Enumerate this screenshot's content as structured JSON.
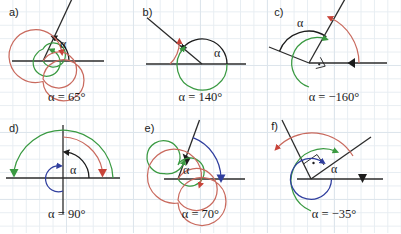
{
  "figure": {
    "background": "#ffffff",
    "grid_color": "#e7edf2",
    "colors": {
      "axis": "#2b2b2b",
      "ray": "#2b2b2b",
      "angle_arc": "#1c1c1c",
      "green": "#3a9a42",
      "red": "#c8443a",
      "salmon": "#c96a5e",
      "blue": "#2f3e9e",
      "text": "#1c1c1c"
    },
    "width": 401,
    "height": 233
  },
  "panels": [
    {
      "id": "a",
      "label": "a)",
      "alpha_symbol": "α",
      "equation": "α = 65°",
      "angle_deg": 65,
      "arcs": [
        {
          "name": "angle-arc",
          "color": "#1c1c1c",
          "direction": "counterclockwise",
          "from_deg": 0,
          "to_deg": 65,
          "turns": 0
        },
        {
          "name": "green-coterminal-arc",
          "color": "#3a9a42",
          "direction": "counterclockwise",
          "from_deg": 0,
          "to_deg": 65,
          "turns": 1
        },
        {
          "name": "red-coterminal-arc",
          "color": "#c8443a",
          "direction": "counterclockwise",
          "from_deg": 0,
          "to_deg": 65,
          "turns": 2
        }
      ],
      "has_right_angle_marker": false,
      "has_vertical_axis": false
    },
    {
      "id": "b",
      "label": "b)",
      "alpha_symbol": "α",
      "equation": "α = 140°",
      "angle_deg": 140,
      "arcs": [
        {
          "name": "angle-arc",
          "color": "#1c1c1c",
          "direction": "counterclockwise",
          "from_deg": 0,
          "to_deg": 140,
          "turns": 0
        },
        {
          "name": "green-coterminal-arc",
          "color": "#3a9a42",
          "direction": "counterclockwise",
          "from_deg": 0,
          "to_deg": 140,
          "turns": 1
        },
        {
          "name": "red-coterminal-arc",
          "color": "#c8443a",
          "direction": "counterclockwise",
          "from_deg": 0,
          "to_deg": 140,
          "turns": 1
        }
      ],
      "has_right_angle_marker": false,
      "has_vertical_axis": false
    },
    {
      "id": "c",
      "label": "c)",
      "alpha_symbol": "α",
      "equation": "α = −160°",
      "angle_deg": -160,
      "arcs": [
        {
          "name": "angle-arc",
          "color": "#1c1c1c",
          "direction": "counterclockwise",
          "from_deg": 20,
          "to_deg": 180,
          "turns": 0
        },
        {
          "name": "green-coterminal-arc",
          "color": "#3a9a42",
          "direction": "counterclockwise",
          "from_deg": 100,
          "to_deg": 100,
          "turns": 1
        },
        {
          "name": "red-coterminal-arc",
          "color": "#c8443a",
          "direction": "clockwise",
          "from_deg": 0,
          "to_deg": -160,
          "turns": 0
        }
      ],
      "has_right_angle_marker": true,
      "has_vertical_axis": false
    },
    {
      "id": "d",
      "label": "d)",
      "alpha_symbol": "α",
      "equation": "α = 90°",
      "angle_deg": 90,
      "arcs": [
        {
          "name": "angle-arc",
          "color": "#1c1c1c",
          "direction": "counterclockwise",
          "from_deg": 0,
          "to_deg": 90,
          "turns": 0
        },
        {
          "name": "blue-inner-arc",
          "color": "#2f3e9e",
          "direction": "counterclockwise",
          "from_deg": 0,
          "to_deg": 90,
          "turns": 1
        },
        {
          "name": "red-coterminal-arc",
          "color": "#c8443a",
          "direction": "counterclockwise",
          "from_deg": 0,
          "to_deg": 90,
          "turns": 0
        },
        {
          "name": "green-coterminal-arc",
          "color": "#3a9a42",
          "direction": "counterclockwise",
          "from_deg": 0,
          "to_deg": 180,
          "turns": 0
        }
      ],
      "has_right_angle_marker": false,
      "has_vertical_axis": true
    },
    {
      "id": "e",
      "label": "e)",
      "alpha_symbol": "α",
      "equation": "α = 70°",
      "angle_deg": 70,
      "arcs": [
        {
          "name": "blue-angle-arc",
          "color": "#2f3e9e",
          "direction": "clockwise",
          "from_deg": 70,
          "to_deg": 0,
          "turns": 0
        },
        {
          "name": "green-coterminal-arc",
          "color": "#3a9a42",
          "direction": "counterclockwise",
          "from_deg": 0,
          "to_deg": 70,
          "turns": 1
        },
        {
          "name": "red-coterminal-arc",
          "color": "#c8443a",
          "direction": "counterclockwise",
          "from_deg": 0,
          "to_deg": 70,
          "turns": 2
        }
      ],
      "has_right_angle_marker": false,
      "has_vertical_axis": false
    },
    {
      "id": "f",
      "label": "f)",
      "alpha_symbol": "α",
      "equation": "α = −35°",
      "angle_deg": -35,
      "arcs": [
        {
          "name": "blue-coterminal-arc",
          "color": "#2f3e9e",
          "direction": "counterclockwise",
          "from_deg": 0,
          "to_deg": 325,
          "turns": 0
        },
        {
          "name": "green-coterminal-arc",
          "color": "#3a9a42",
          "direction": "counterclockwise",
          "from_deg": 35,
          "to_deg": 325,
          "turns": 1
        },
        {
          "name": "red-coterminal-arc",
          "color": "#c8443a",
          "direction": "clockwise",
          "from_deg": 35,
          "to_deg": -140,
          "turns": 0
        }
      ],
      "has_right_angle_marker": true,
      "has_vertical_axis": false
    }
  ]
}
